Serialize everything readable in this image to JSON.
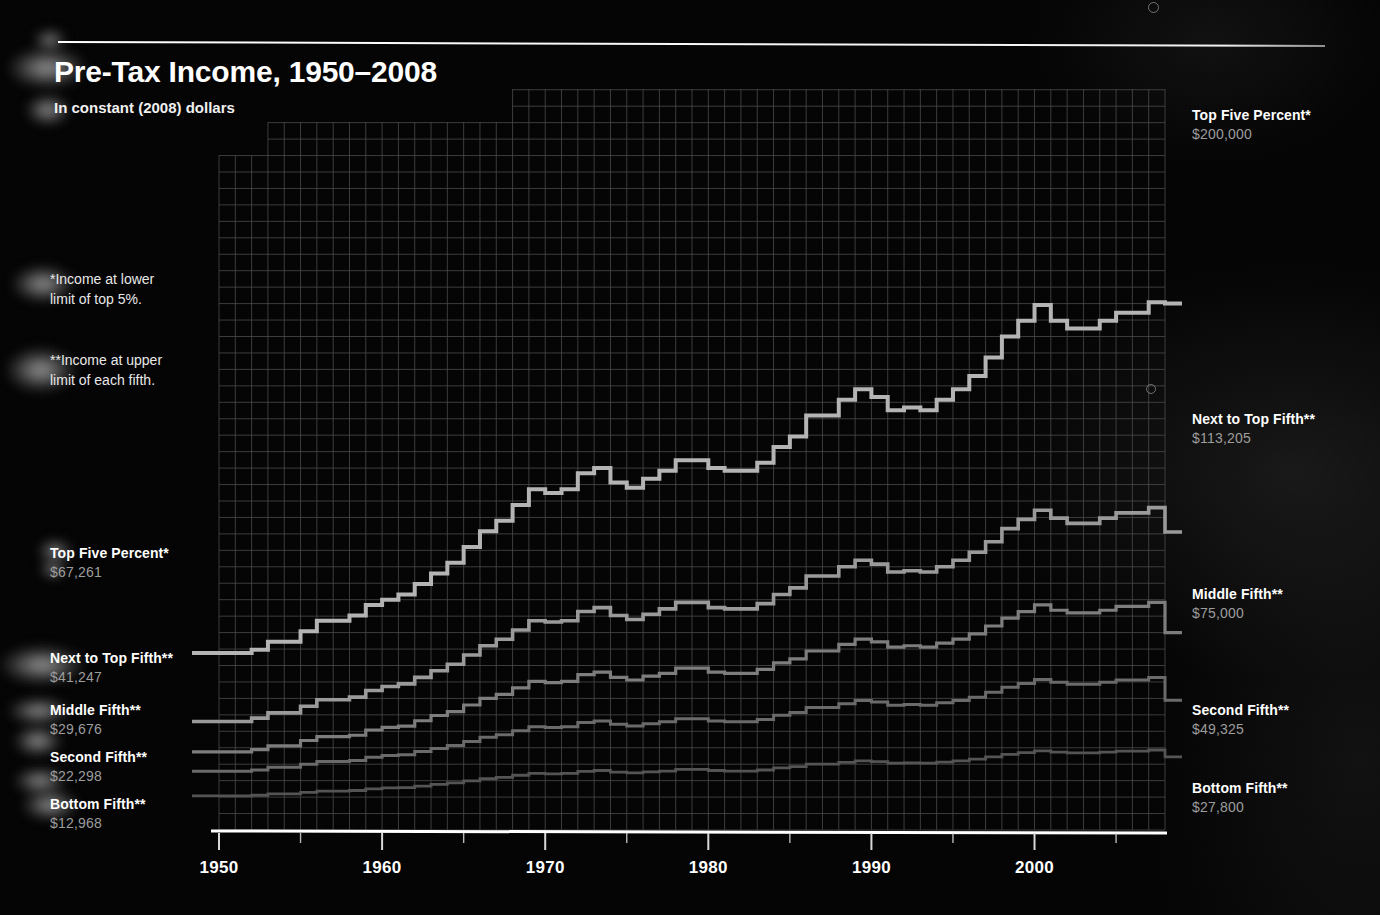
{
  "header": {
    "title": "Pre-Tax Income, 1950–2008",
    "subtitle": "In constant (2008) dollars"
  },
  "footnotes": [
    {
      "id": "lower-limit",
      "text": "*Income at lower\nlimit of top 5%."
    },
    {
      "id": "upper-limit",
      "text": "**Income at upper\nlimit of each fifth."
    }
  ],
  "axis": {
    "x_ticks": [
      "1950",
      "1960",
      "1970",
      "1980",
      "1990",
      "2000"
    ],
    "x_tick_values": [
      1950,
      1960,
      1970,
      1980,
      1990,
      2000
    ],
    "x_minor_step": 5,
    "x_min": 1950,
    "x_max": 2008,
    "y_min": 0,
    "y_max": 215000
  },
  "labels_left": [
    {
      "name": "Top Five Percent*",
      "value": "$67,261"
    },
    {
      "name": "Next to Top Fifth**",
      "value": "$41,247"
    },
    {
      "name": "Middle Fifth**",
      "value": "$29,676"
    },
    {
      "name": "Second Fifth**",
      "value": "$22,298"
    },
    {
      "name": "Bottom Fifth**",
      "value": "$12,968"
    }
  ],
  "labels_right": [
    {
      "name": "Top Five Percent*",
      "value": "$200,000"
    },
    {
      "name": "Next to Top Fifth**",
      "value": "$113,205"
    },
    {
      "name": "Middle Fifth**",
      "value": "$75,000"
    },
    {
      "name": "Second Fifth**",
      "value": "$49,325"
    },
    {
      "name": "Bottom Fifth**",
      "value": "$27,800"
    }
  ],
  "colors": {
    "background": "#040404",
    "grid": "#4a4a4a",
    "axis": "#ffffff",
    "top_five": "#b4b4b4",
    "next_to_top": "#9a9a9a",
    "middle": "#7d7d7d",
    "second": "#6a6a6a",
    "bottom": "#545454",
    "label_value": "#9d9d9d"
  },
  "chart_data": {
    "type": "line",
    "title": "Pre-Tax Income, 1950–2008",
    "subtitle": "In constant (2008) dollars",
    "xlabel": "",
    "ylabel": "",
    "xlim": [
      1950,
      2008
    ],
    "ylim": [
      0,
      215000
    ],
    "grid": true,
    "legend_position": "right-of-plot and left-of-plot (series end labels)",
    "step_style": "step-post",
    "x": [
      1950,
      1951,
      1952,
      1953,
      1954,
      1955,
      1956,
      1957,
      1958,
      1959,
      1960,
      1961,
      1962,
      1963,
      1964,
      1965,
      1966,
      1967,
      1968,
      1969,
      1970,
      1971,
      1972,
      1973,
      1974,
      1975,
      1976,
      1977,
      1978,
      1979,
      1980,
      1981,
      1982,
      1983,
      1984,
      1985,
      1986,
      1987,
      1988,
      1989,
      1990,
      1991,
      1992,
      1993,
      1994,
      1995,
      1996,
      1997,
      1998,
      1999,
      2000,
      2001,
      2002,
      2003,
      2004,
      2005,
      2006,
      2007,
      2008
    ],
    "series": [
      {
        "name": "Top Five Percent*",
        "note": "Income at lower limit of top 5%.",
        "color": "#b4b4b4",
        "start_value": 67261,
        "end_value": 200000,
        "values": [
          67261,
          67261,
          68500,
          71500,
          71500,
          75500,
          79500,
          79500,
          81500,
          85500,
          87500,
          89500,
          93500,
          97500,
          101500,
          107500,
          113500,
          117500,
          123500,
          129500,
          128000,
          129500,
          135500,
          137500,
          132000,
          130000,
          133500,
          136500,
          140500,
          140500,
          137500,
          136500,
          136500,
          139500,
          145500,
          149500,
          157500,
          157500,
          163500,
          167500,
          164500,
          159500,
          160500,
          159500,
          163500,
          167500,
          172500,
          179500,
          187500,
          193500,
          199500,
          193500,
          190500,
          190500,
          193500,
          196500,
          196500,
          200500,
          200000
        ]
      },
      {
        "name": "Next to Top Fifth**",
        "note": "Income at upper limit of each fifth.",
        "color": "#9a9a9a",
        "start_value": 41247,
        "end_value": 113205,
        "values": [
          41247,
          41247,
          42500,
          44500,
          44500,
          47000,
          49500,
          49500,
          50500,
          53000,
          54500,
          55500,
          58000,
          60500,
          63000,
          66500,
          70000,
          72500,
          76000,
          79500,
          79000,
          79500,
          83000,
          84500,
          81500,
          80000,
          82000,
          84000,
          86500,
          86500,
          84500,
          84000,
          84000,
          86000,
          89500,
          92000,
          96500,
          96500,
          100000,
          102500,
          101000,
          98000,
          98500,
          98000,
          100000,
          102500,
          105500,
          109500,
          114500,
          118000,
          121500,
          118500,
          116500,
          116500,
          118500,
          120500,
          120500,
          122500,
          113205
        ]
      },
      {
        "name": "Middle Fifth**",
        "color": "#7d7d7d",
        "start_value": 29676,
        "end_value": 75000,
        "values": [
          29676,
          29676,
          30500,
          32000,
          32000,
          34000,
          35500,
          35500,
          36000,
          38000,
          39000,
          39500,
          41500,
          43500,
          45000,
          47500,
          50000,
          51500,
          54000,
          56500,
          56000,
          56500,
          59000,
          60000,
          58000,
          57000,
          58500,
          59500,
          61500,
          61500,
          60000,
          59500,
          59500,
          61000,
          63500,
          65000,
          68000,
          68000,
          70500,
          72500,
          71500,
          69500,
          70000,
          69500,
          71000,
          72500,
          74500,
          77500,
          80500,
          83000,
          85500,
          83500,
          82500,
          82500,
          83500,
          85000,
          85000,
          86500,
          75000
        ]
      },
      {
        "name": "Second Fifth**",
        "color": "#6a6a6a",
        "start_value": 22298,
        "end_value": 49325,
        "values": [
          22298,
          22298,
          22800,
          23800,
          23800,
          25000,
          26000,
          26000,
          26400,
          27600,
          28300,
          28600,
          29800,
          31000,
          32100,
          33600,
          35200,
          36200,
          37700,
          39200,
          38900,
          39200,
          40800,
          41400,
          40200,
          39500,
          40400,
          41100,
          42300,
          42300,
          41400,
          41100,
          41100,
          42000,
          43600,
          44600,
          46500,
          46500,
          48000,
          49200,
          48600,
          47400,
          47700,
          47400,
          48300,
          49200,
          50400,
          52300,
          54200,
          55700,
          57200,
          56100,
          55400,
          55400,
          56100,
          57000,
          57000,
          57900,
          49325
        ]
      },
      {
        "name": "Bottom Fifth**",
        "color": "#545454",
        "start_value": 12968,
        "end_value": 27800,
        "values": [
          12968,
          12968,
          13200,
          13700,
          13700,
          14300,
          14800,
          14800,
          15000,
          15600,
          16000,
          16100,
          16700,
          17300,
          17900,
          18700,
          19500,
          20000,
          20800,
          21500,
          21300,
          21500,
          22300,
          22600,
          22000,
          21700,
          22100,
          22400,
          23000,
          23000,
          22600,
          22400,
          22400,
          22800,
          23600,
          24100,
          25000,
          25000,
          25700,
          26300,
          26000,
          25400,
          25500,
          25400,
          25800,
          26300,
          26900,
          27800,
          28700,
          29400,
          30100,
          29600,
          29300,
          29300,
          29600,
          30000,
          30000,
          30400,
          27800
        ]
      }
    ]
  }
}
